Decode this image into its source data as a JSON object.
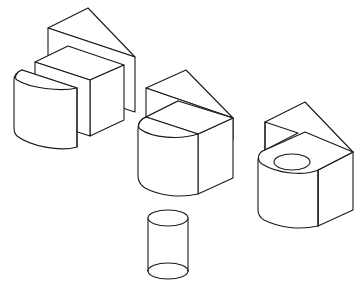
{
  "figure": {
    "background": "#ffffff",
    "stroke_color": "#1a1a1a",
    "objects": [
      {
        "id": "composite-left",
        "parts": [
          "triangular-prism",
          "cube",
          "half-cylinder"
        ]
      },
      {
        "id": "composite-middle",
        "parts": [
          "triangular-prism",
          "half-cylinder-box"
        ]
      },
      {
        "id": "composite-right",
        "parts": [
          "notched-prism",
          "rounded-block-with-hole"
        ]
      },
      {
        "id": "cylinder",
        "parts": [
          "cylinder"
        ]
      }
    ]
  }
}
